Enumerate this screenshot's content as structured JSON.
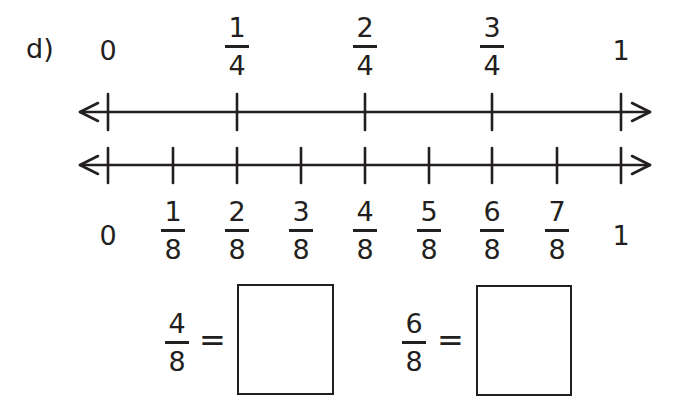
{
  "problem": {
    "label": "d)"
  },
  "top_line": {
    "labels": [
      {
        "type": "whole",
        "text": "0",
        "x": 108
      },
      {
        "type": "fraction",
        "numerator": "1",
        "denominator": "4",
        "x": 237
      },
      {
        "type": "fraction",
        "numerator": "2",
        "denominator": "4",
        "x": 365
      },
      {
        "type": "fraction",
        "numerator": "3",
        "denominator": "4",
        "x": 492
      },
      {
        "type": "whole",
        "text": "1",
        "x": 621
      }
    ]
  },
  "bottom_line": {
    "labels": [
      {
        "type": "whole",
        "text": "0",
        "x": 108
      },
      {
        "type": "fraction",
        "numerator": "1",
        "denominator": "8",
        "x": 173
      },
      {
        "type": "fraction",
        "numerator": "2",
        "denominator": "8",
        "x": 237
      },
      {
        "type": "fraction",
        "numerator": "3",
        "denominator": "8",
        "x": 301
      },
      {
        "type": "fraction",
        "numerator": "4",
        "denominator": "8",
        "x": 365
      },
      {
        "type": "fraction",
        "numerator": "5",
        "denominator": "8",
        "x": 429
      },
      {
        "type": "fraction",
        "numerator": "6",
        "denominator": "8",
        "x": 492
      },
      {
        "type": "fraction",
        "numerator": "7",
        "denominator": "8",
        "x": 557
      },
      {
        "type": "whole",
        "text": "1",
        "x": 621
      }
    ]
  },
  "equations": [
    {
      "numerator": "4",
      "denominator": "8",
      "equals": "=",
      "answer": ""
    },
    {
      "numerator": "6",
      "denominator": "8",
      "equals": "=",
      "answer": ""
    }
  ],
  "colors": {
    "ink": "#231f20",
    "background": "#ffffff"
  }
}
